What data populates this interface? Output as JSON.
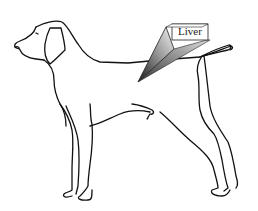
{
  "diagram": {
    "callout": {
      "label": "Liver",
      "target": "liver"
    },
    "colors": {
      "outline": "#111111",
      "background": "#ffffff",
      "callout_dark": "#333333",
      "callout_light": "#f2f2f2"
    }
  }
}
